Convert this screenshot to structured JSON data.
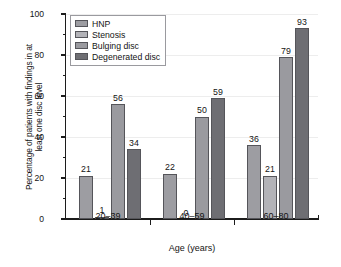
{
  "chart_data": {
    "type": "bar",
    "title": "",
    "subtitle": "",
    "xlabel": "Age (years)",
    "ylabel": "Percentage of patients with findings in at least one disc level",
    "categories": [
      "20–39",
      "40–59",
      "60–80"
    ],
    "series": [
      {
        "name": "HNP",
        "values": [
          21,
          22,
          36
        ],
        "color": "#9d9da2"
      },
      {
        "name": "Stenosis",
        "values": [
          1,
          0,
          21
        ],
        "color": "#b3b3b8"
      },
      {
        "name": "Bulging disc",
        "values": [
          56,
          50,
          79
        ],
        "color": "#9a9a9f"
      },
      {
        "name": "Degenerated disc",
        "values": [
          34,
          59,
          93
        ],
        "color": "#6e6e73"
      }
    ],
    "ylim": [
      0,
      100
    ],
    "yticks": [
      0,
      20,
      40,
      60,
      80,
      100
    ],
    "ytick_labels": [
      "0",
      "20",
      "40",
      "60",
      "80",
      "100"
    ],
    "yminor_ticks": [
      10,
      30,
      50,
      70,
      90
    ],
    "xlim_groups": 3,
    "grid": false,
    "legend_position": "top-left",
    "data_labels": true,
    "data_label_values": [
      [
        "21",
        "1",
        "56",
        "34"
      ],
      [
        "22",
        "0",
        "50",
        "59"
      ],
      [
        "36",
        "21",
        "79",
        "93"
      ]
    ]
  },
  "legend": {
    "items": [
      {
        "label": "HNP"
      },
      {
        "label": "Stenosis"
      },
      {
        "label": "Bulging disc"
      },
      {
        "label": "Degenerated disc"
      }
    ]
  },
  "axes": {
    "x_title": "Age (years)",
    "y_title": "Percentage of patients with findings in at\nleast one disc level",
    "y_title_line1": "Percentage of patients with findings in at",
    "y_title_line2": "least one disc level"
  }
}
